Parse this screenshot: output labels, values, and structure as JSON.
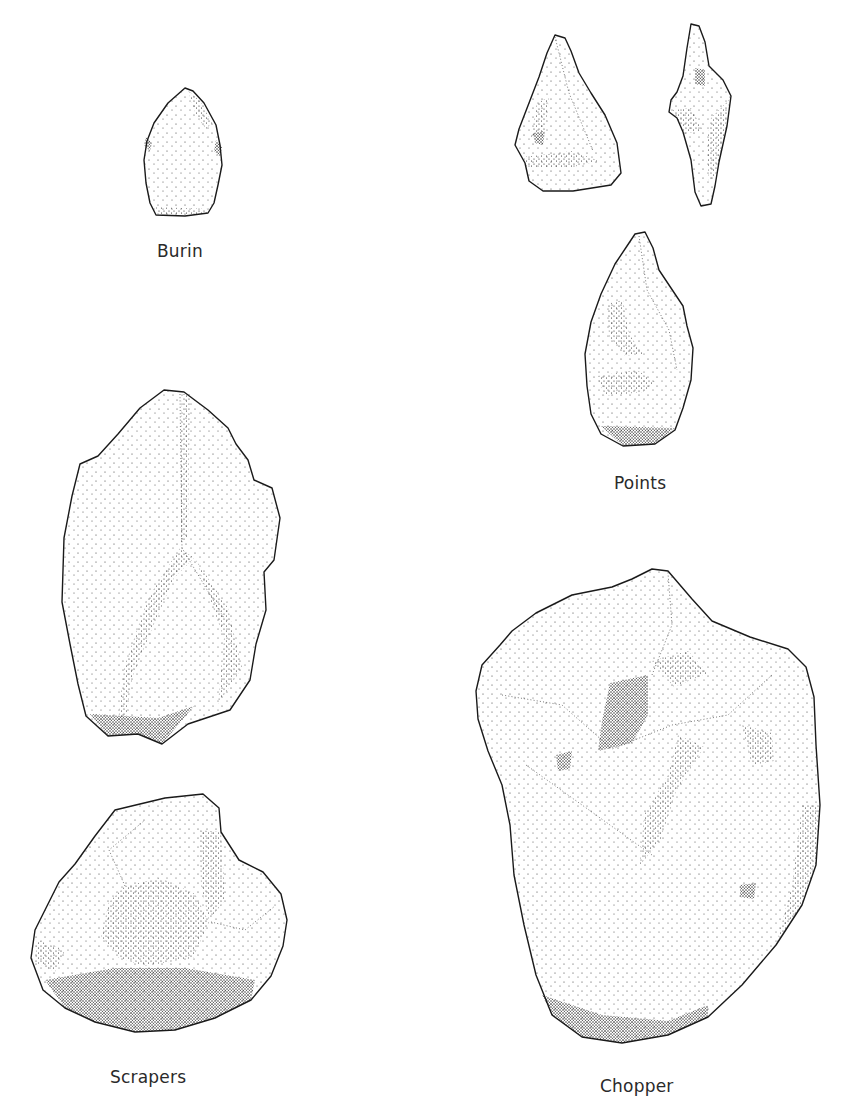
{
  "plate": {
    "background": "#ffffff",
    "ink_color": "#1a1a1a"
  },
  "artifacts": [
    {
      "id": "burin",
      "label": "Burin"
    },
    {
      "id": "points",
      "label": "Points"
    },
    {
      "id": "scrapers",
      "label": "Scrapers"
    },
    {
      "id": "chopper",
      "label": "Chopper"
    }
  ]
}
